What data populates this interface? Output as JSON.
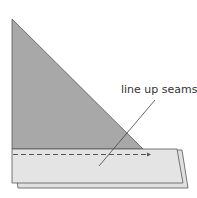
{
  "diagram": {
    "annotation": "line up seams",
    "colors": {
      "triangle_fill": "#a8a8a8",
      "strip_fill": "#e2e2e2",
      "outline": "#555555",
      "text": "#333333",
      "seam_dash": "#555555"
    }
  }
}
